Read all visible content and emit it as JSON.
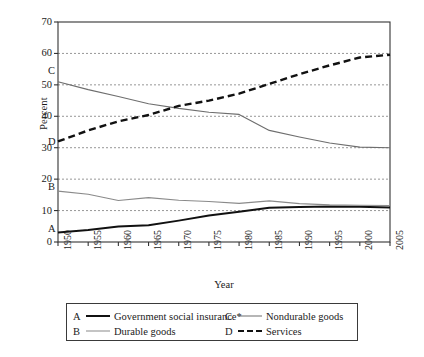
{
  "chart_data": {
    "type": "line",
    "title": "",
    "xlabel": "Year",
    "ylabel": "Percent",
    "xlim": [
      1950,
      2005
    ],
    "ylim": [
      0,
      70
    ],
    "ytick_values": [
      0,
      10,
      20,
      30,
      40,
      50,
      60,
      70
    ],
    "ytick_labels": [
      "0",
      "10",
      "20",
      "30",
      "40",
      "50",
      "60",
      "70"
    ],
    "grid": "horizontal-dashed",
    "legend_position": "below-plot",
    "x": [
      1950,
      1955,
      1960,
      1965,
      1970,
      1975,
      1980,
      1985,
      1990,
      1995,
      2000,
      2005
    ],
    "xtick_labels": [
      "1950",
      "1955",
      "1960",
      "1965",
      "1970",
      "1975",
      "1980",
      "1985",
      "1990",
      "1995",
      "2000",
      "2005"
    ],
    "series": [
      {
        "key": "A",
        "name": "Government social insurance*",
        "style": "solid-thick-black",
        "color": "#111111",
        "values": [
          3.0,
          3.8,
          4.9,
          5.3,
          6.8,
          8.4,
          9.6,
          10.9,
          11.1,
          11.3,
          11.2,
          11.0
        ],
        "inplot_label": "A"
      },
      {
        "key": "B",
        "name": "Durable goods",
        "style": "solid-thin-gray",
        "color": "#8a8a8a",
        "values": [
          16.2,
          15.2,
          13.2,
          14.1,
          13.3,
          12.9,
          12.3,
          13.1,
          12.2,
          11.8,
          11.7,
          11.6
        ],
        "inplot_label": "B"
      },
      {
        "key": "C",
        "name": "Nondurable goods",
        "style": "solid-thin-gray",
        "color": "#6e6e6e",
        "values": [
          51.0,
          48.5,
          46.3,
          44.0,
          42.5,
          41.3,
          40.6,
          35.5,
          33.4,
          31.5,
          30.2,
          30.0
        ],
        "inplot_label": "C"
      },
      {
        "key": "D",
        "name": "Services",
        "style": "dashed-thick-black",
        "color": "#111111",
        "values": [
          32.0,
          35.5,
          38.4,
          40.4,
          43.3,
          45.0,
          47.2,
          50.3,
          53.4,
          56.2,
          58.7,
          59.6
        ],
        "inplot_label": "D"
      }
    ]
  },
  "legend": {
    "entries": [
      {
        "key": "A",
        "label": "Government social insurance*"
      },
      {
        "key": "B",
        "label": "Durable goods"
      },
      {
        "key": "C",
        "label": "Nondurable goods"
      },
      {
        "key": "D",
        "label": "Services"
      }
    ]
  },
  "axes": {
    "y_title": "Percent",
    "x_title": "Year"
  }
}
